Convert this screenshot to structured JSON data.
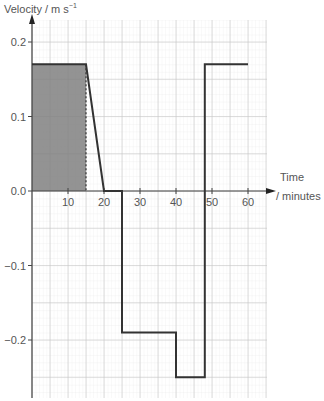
{
  "chart_data": {
    "type": "line",
    "title": "",
    "xlabel": "Time / minutes",
    "ylabel": "Velocity / m s⁻¹",
    "xlim": [
      0,
      65
    ],
    "ylim": [
      -0.27,
      0.22
    ],
    "x_ticks": [
      10,
      20,
      30,
      40,
      50,
      60
    ],
    "x_tick_labels": [
      "10",
      "20",
      "30",
      "40",
      "50",
      "60"
    ],
    "y_ticks": [
      0.2,
      0.1,
      0.0,
      -0.1,
      -0.2
    ],
    "y_tick_labels": [
      "0.2",
      "0.1",
      "0.0",
      "−0.1",
      "−0.2"
    ],
    "grid": true,
    "series": [
      {
        "name": "velocity",
        "x": [
          0,
          15,
          20,
          25,
          25,
          40,
          40,
          48,
          48,
          60
        ],
        "y": [
          0.17,
          0.17,
          0.0,
          0.0,
          -0.19,
          -0.19,
          -0.25,
          -0.25,
          0.17,
          0.17
        ]
      }
    ],
    "shaded_region": {
      "x_range": [
        0,
        15
      ],
      "y_range": [
        0,
        0.17
      ],
      "color": "#808080",
      "dashed_right_edge": true
    },
    "annotations": []
  },
  "labels": {
    "y_axis_title": "Velocity / m s",
    "y_axis_exponent": "−1",
    "x_axis_title_line1": "Time",
    "x_axis_title_line2": "/ minutes"
  }
}
